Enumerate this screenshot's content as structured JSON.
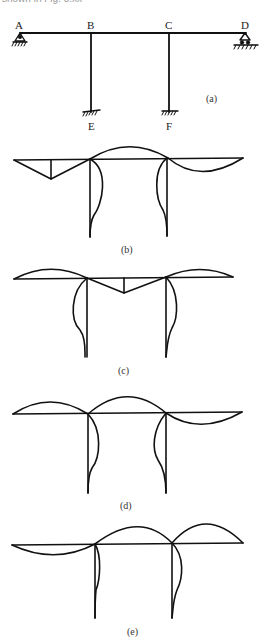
{
  "header_fragment": "shown in Fig. 8.xx",
  "figure": {
    "joints": {
      "A": "A",
      "B": "B",
      "C": "C",
      "D": "D",
      "E": "E",
      "F": "F"
    },
    "supports": {
      "A": "pin-support-icon",
      "D": "roller-support-icon",
      "E": "fixed-support-icon",
      "F": "fixed-support-icon"
    },
    "captions": {
      "a": "(a)",
      "b": "(b)",
      "c": "(c)",
      "d": "(d)",
      "e": "(e)"
    }
  }
}
